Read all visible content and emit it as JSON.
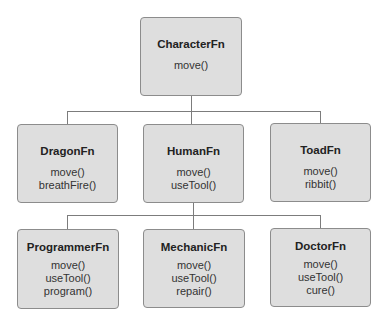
{
  "diagram": {
    "type": "class-hierarchy",
    "colors": {
      "box_fill": "#dedede",
      "box_border": "#8c8c8c",
      "connector": "#7c7c7c"
    },
    "root": {
      "name": "CharacterFn",
      "methods": [
        "move()"
      ]
    },
    "level1": [
      {
        "name": "DragonFn",
        "methods": [
          "move()",
          "breathFire()"
        ]
      },
      {
        "name": "HumanFn",
        "methods": [
          "move()",
          "useTool()"
        ]
      },
      {
        "name": "ToadFn",
        "methods": [
          "move()",
          "ribbit()"
        ]
      }
    ],
    "level2": [
      {
        "name": "ProgrammerFn",
        "parent": "HumanFn",
        "methods": [
          "move()",
          "useTool()",
          "program()"
        ]
      },
      {
        "name": "MechanicFn",
        "parent": "HumanFn",
        "methods": [
          "move()",
          "useTool()",
          "repair()"
        ]
      },
      {
        "name": "DoctorFn",
        "parent": "HumanFn",
        "methods": [
          "move()",
          "useTool()",
          "cure()"
        ]
      }
    ]
  }
}
